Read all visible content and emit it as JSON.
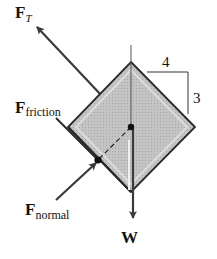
{
  "diagram": {
    "labels": {
      "tension_main": "F",
      "tension_sub": "T",
      "friction_main": "F",
      "friction_sub": "friction",
      "normal_main": "F",
      "normal_sub": "normal",
      "weight": "W",
      "slope_run": "4",
      "slope_rise": "3"
    },
    "colors": {
      "block_fill": "#bdbdbd",
      "block_edge": "#2a2a2a",
      "arrow": "#3a3a3a",
      "text": "#111111"
    }
  }
}
